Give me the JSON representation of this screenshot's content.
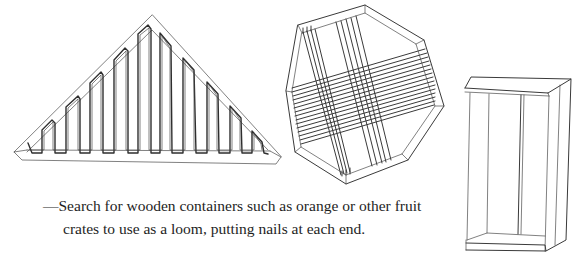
{
  "figure": {
    "illustrations": [
      {
        "name": "triangular-loom",
        "description": "Triangular wooden frame loom with zig-zag warp strung on nails"
      },
      {
        "name": "octagonal-loom",
        "description": "Octagonal wooden frame loom with crossing warp and weft threads"
      },
      {
        "name": "fruit-crate-loom",
        "description": "Open wooden fruit crate standing upright"
      }
    ]
  },
  "caption": {
    "line1": "—Search for wooden containers such as orange or other fruit",
    "line2": "crates to use as a loom, putting nails at each end."
  },
  "colors": {
    "ink": "#3a3a3a",
    "paper": "#ffffff"
  }
}
